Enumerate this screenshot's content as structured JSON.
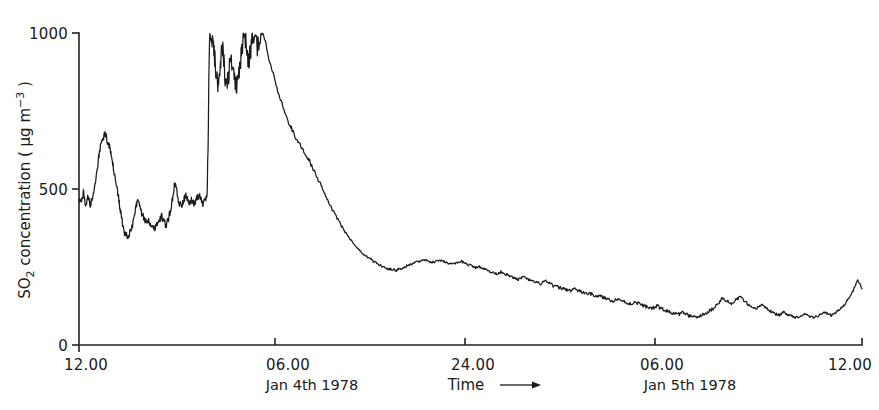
{
  "figure": {
    "background_color": "#ffffff",
    "ink_color": "#1b1b1b"
  },
  "chart_data": {
    "type": "line",
    "title": "",
    "subtitle": "",
    "xlabel": "Time",
    "xlabel_arrow": "⟶",
    "ylabel_main": "SO",
    "ylabel_sub": "2",
    "ylabel_rest": " concentration ( μg m",
    "ylabel_sup": "−3",
    "ylabel_close": " )",
    "ylabel_full": "SO2 concentration ( μg m-3 )",
    "ylim": [
      0,
      1000
    ],
    "yticks": [
      0,
      500,
      1000
    ],
    "ytick_labels": [
      "0",
      "500",
      "1000"
    ],
    "xlim": [
      12,
      48
    ],
    "xticks": [
      12,
      18,
      24,
      30,
      36,
      42,
      48
    ],
    "xtick_labels_shown": [
      "12.00",
      "06.00",
      "24.00",
      "06.00",
      "12.00"
    ],
    "xtick_positions_shown": [
      12,
      18,
      24,
      30,
      36,
      42,
      48
    ],
    "xticks_labeled": [
      {
        "x": 12,
        "label": "12.00",
        "date": ""
      },
      {
        "x": 18,
        "label": "06.00",
        "date": "Jan 4th 1978"
      },
      {
        "x": 24,
        "label": "24.00",
        "date": ""
      },
      {
        "x": 30,
        "label": "06.00",
        "date": "Jan 5th 1978"
      },
      {
        "x": 36,
        "label": "12.00",
        "date": ""
      }
    ],
    "grid": false,
    "legend": false,
    "legend_position": "none",
    "series": [
      {
        "name": "SO2 concentration",
        "color": "#1b1b1b",
        "x": [
          12.0,
          12.1,
          12.2,
          12.3,
          12.4,
          12.5,
          12.6,
          12.7,
          12.8,
          12.9,
          13.0,
          13.1,
          13.2,
          13.3,
          13.4,
          13.5,
          13.6,
          13.7,
          13.8,
          13.9,
          14.0,
          14.1,
          14.2,
          14.3,
          14.4,
          14.5,
          14.6,
          14.7,
          14.8,
          14.9,
          15.0,
          15.1,
          15.2,
          15.3,
          15.4,
          15.5,
          15.6,
          15.7,
          15.8,
          15.9,
          16.0,
          16.1,
          16.2,
          16.3,
          16.4,
          16.5,
          16.6,
          16.7,
          16.8,
          16.9,
          17.0,
          17.1,
          17.2,
          17.3,
          17.4,
          17.5,
          17.6,
          17.7,
          17.8,
          17.9,
          18.0,
          18.1,
          18.2,
          18.3,
          18.4,
          18.5,
          18.6,
          18.7,
          18.8,
          18.9,
          19.0,
          19.1,
          19.2,
          19.3,
          19.4,
          19.5,
          19.6,
          19.7,
          19.8,
          19.9,
          20.0,
          20.2,
          20.4,
          20.6,
          20.8,
          21.0,
          21.2,
          21.4,
          21.6,
          21.8,
          22.0,
          22.2,
          22.4,
          22.6,
          22.8,
          23.0,
          23.2,
          23.4,
          23.6,
          23.8,
          24.0,
          24.2,
          24.4,
          24.6,
          24.8,
          25.0,
          25.2,
          25.4,
          25.6,
          25.8,
          26.0,
          26.2,
          26.4,
          26.6,
          26.8,
          27.0,
          27.2,
          27.4,
          27.6,
          27.8,
          28.0,
          28.2,
          28.4,
          28.6,
          28.8,
          29.0,
          29.2,
          29.4,
          29.6,
          29.8,
          30.0,
          30.2,
          30.4,
          30.6,
          30.8,
          31.0,
          31.2,
          31.4,
          31.6,
          31.8,
          32.0,
          32.2,
          32.4,
          32.6,
          32.8,
          33.0,
          33.2,
          33.4,
          33.6,
          33.8,
          34.0,
          34.2,
          34.4,
          34.6,
          34.8,
          35.0,
          35.2,
          35.4,
          35.6,
          35.8,
          36.0,
          36.2,
          36.4,
          36.6,
          36.8,
          37.0,
          37.2,
          37.4,
          37.6,
          37.8,
          38.0,
          38.2,
          38.4,
          38.6,
          38.8,
          39.0,
          39.2,
          39.4,
          39.6,
          39.8,
          40.0,
          40.2,
          40.4,
          40.6,
          40.8,
          41.0,
          41.2,
          41.4,
          41.6,
          41.8,
          42.0,
          42.2,
          42.4,
          42.6,
          42.8,
          43.0,
          43.2,
          43.4,
          43.6,
          43.8,
          44.0,
          44.2,
          44.4,
          44.6,
          44.8,
          45.0,
          45.2,
          45.4,
          45.6,
          45.8,
          46.0,
          46.2,
          46.4,
          46.6,
          46.8,
          47.0,
          47.2,
          47.4,
          47.6,
          47.8,
          48.0
        ],
        "y": [
          470,
          455,
          490,
          445,
          480,
          450,
          465,
          500,
          545,
          600,
          640,
          660,
          680,
          655,
          635,
          600,
          560,
          520,
          480,
          430,
          390,
          360,
          350,
          355,
          370,
          400,
          440,
          465,
          440,
          420,
          405,
          395,
          400,
          390,
          380,
          375,
          390,
          400,
          415,
          395,
          385,
          400,
          430,
          470,
          520,
          490,
          455,
          445,
          460,
          480,
          470,
          455,
          470,
          450,
          465,
          480,
          470,
          455,
          465,
          480,
          975,
          1000,
          940,
          880,
          830,
          900,
          950,
          870,
          820,
          880,
          930,
          870,
          820,
          860,
          900,
          960,
          1010,
          960,
          900,
          950,
          1000,
          950,
          1020,
          960,
          900,
          850,
          800,
          760,
          720,
          690,
          660,
          640,
          615,
          590,
          560,
          530,
          500,
          470,
          440,
          415,
          390,
          365,
          345,
          325,
          310,
          295,
          285,
          275,
          265,
          258,
          250,
          245,
          242,
          240,
          245,
          252,
          258,
          263,
          268,
          272,
          270,
          265,
          268,
          272,
          268,
          262,
          258,
          262,
          268,
          260,
          255,
          248,
          252,
          245,
          238,
          232,
          228,
          235,
          228,
          220,
          215,
          210,
          218,
          212,
          205,
          200,
          196,
          205,
          198,
          190,
          186,
          182,
          178,
          175,
          180,
          172,
          168,
          165,
          162,
          158,
          155,
          150,
          145,
          142,
          148,
          140,
          135,
          132,
          138,
          130,
          125,
          120,
          118,
          125,
          115,
          110,
          105,
          100,
          98,
          105,
          95,
          90,
          88,
          95,
          100,
          110,
          120,
          135,
          150,
          140,
          130,
          145,
          155,
          140,
          125,
          115,
          120,
          130,
          118,
          108,
          100,
          95,
          105,
          98,
          92,
          88,
          95,
          100,
          92,
          88,
          95,
          105,
          100,
          95,
          105,
          115,
          130,
          150,
          175,
          210,
          180
        ],
        "y_units": "μg m-3"
      }
    ],
    "notes": {
      "peak_max": 1020,
      "peak_time_range": "approx 18.00-20.00 Jan 4th",
      "baseline_low": 88,
      "start_value": 470,
      "end_value": 180
    }
  },
  "axes": {
    "y_tick_text": [
      "1000",
      "500",
      "0"
    ],
    "x_tick_text": [
      "12.00",
      "06.00",
      "24.00",
      "06.00",
      "12.00"
    ],
    "date_texts": [
      "Jan 4th 1978",
      "Jan 5th 1978"
    ],
    "time_label": "Time"
  }
}
